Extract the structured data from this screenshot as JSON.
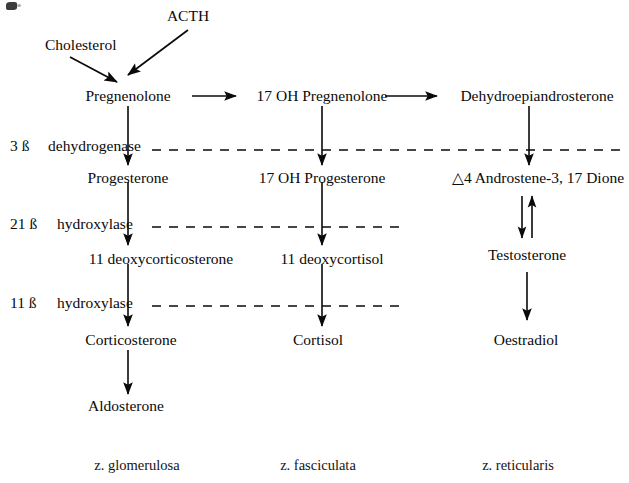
{
  "diagram": {
    "nodes": {
      "acth": "ACTH",
      "cholesterol": "Cholesterol",
      "pregnenolone": "Pregnenolone",
      "oh17_pregnenolone": "17 OH Pregnenolone",
      "dhea": "Dehydroepiandrosterone",
      "progesterone": "Progesterone",
      "oh17_progesterone": "17 OH Progesterone",
      "androstenedione": "△4 Androstene-3, 17 Dione",
      "deoxycorticosterone": "11 deoxycorticosterone",
      "deoxycortisol": "11 deoxycortisol",
      "testosterone": "Testosterone",
      "corticosterone": "Corticosterone",
      "cortisol": "Cortisol",
      "oestradiol": "Oestradiol",
      "aldosterone": "Aldosterone"
    },
    "enzymes": [
      {
        "number": "3 ß",
        "name": "dehydrogenase"
      },
      {
        "number": "21 ß",
        "name": "hydroxylase"
      },
      {
        "number": "11 ß",
        "name": "hydroxylase"
      }
    ],
    "zones": [
      "z. glomerulosa",
      "z. fasciculata",
      "z. reticularis"
    ],
    "colors": {
      "ink": "#0a0a0a",
      "background": "#ffffff"
    }
  }
}
